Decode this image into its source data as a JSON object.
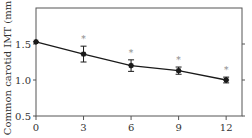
{
  "chart_data": {
    "type": "line",
    "title": "",
    "xlabel": "",
    "ylabel": "Common carotid IMT (mm)",
    "x": [
      0,
      3,
      6,
      9,
      12
    ],
    "xticks": [
      "0",
      "3",
      "6",
      "9",
      "12"
    ],
    "yticks": [
      "0.5",
      "1.0",
      "1.5"
    ],
    "xlim": [
      0,
      13
    ],
    "ylim": [
      0.5,
      2.0
    ],
    "grid": false,
    "legend": null,
    "series": [
      {
        "name": "Common carotid IMT",
        "values": [
          1.53,
          1.36,
          1.2,
          1.13,
          1.0
        ],
        "error": [
          0.0,
          0.11,
          0.08,
          0.05,
          0.04
        ],
        "significance": [
          "",
          "*",
          "*",
          "*",
          "*"
        ]
      }
    ],
    "annotations": [
      "*",
      "*",
      "*",
      "*"
    ]
  },
  "colors": {
    "line": "#1a1a1a",
    "axis": "#555555",
    "asterisk": "#888888"
  }
}
